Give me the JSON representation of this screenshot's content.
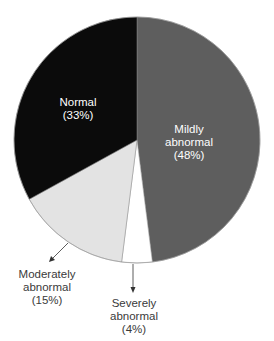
{
  "chart_data": {
    "type": "pie",
    "title": "",
    "start_angle_deg": 0,
    "direction": "clockwise",
    "slices": [
      {
        "label": "Mildly abnormal",
        "value": 48,
        "percent_label": "(48%)",
        "color": "#5e5e5e"
      },
      {
        "label": "Severely abnormal",
        "value": 4,
        "percent_label": "(4%)",
        "color": "#ffffff"
      },
      {
        "label": "Moderately abnormal",
        "value": 15,
        "percent_label": "(15%)",
        "color": "#e3e3e3"
      },
      {
        "label": "Normal",
        "value": 33,
        "percent_label": "(33%)",
        "color": "#0b0b0b"
      }
    ]
  },
  "labels": {
    "normal": {
      "line1": "Normal",
      "line2": "(33%)"
    },
    "mildly": {
      "line1": "Mildly",
      "line2": "abnormal",
      "line3": "(48%)"
    },
    "moderately": {
      "line1": "Moderately",
      "line2": "abnormal",
      "line3": "(15%)"
    },
    "severely": {
      "line1": "Severely",
      "line2": "abnormal",
      "line3": "(4%)"
    }
  }
}
